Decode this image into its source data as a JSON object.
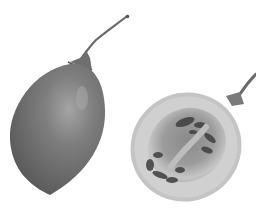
{
  "image": {
    "subject": "Tamarillo fruits: one whole, one cut in half",
    "palette": {
      "background": "#ffffff",
      "skin_dark": "#5a5a5a",
      "skin_mid": "#7a7a7a",
      "skin_highlight": "#a8a8a8",
      "flesh_outer": "#c9c9c9",
      "flesh_inner": "#9a9a9a",
      "seed_zone": "#4a4a4a",
      "core": "#bdbdbd",
      "stem": "#6e6e6e"
    }
  }
}
